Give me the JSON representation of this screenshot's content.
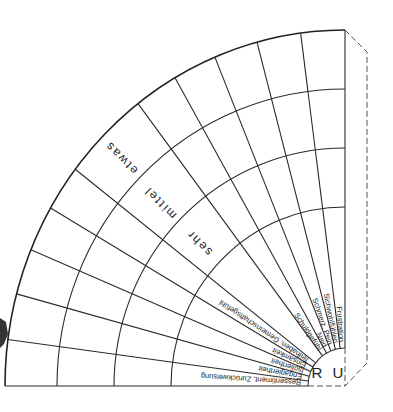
{
  "diagram": {
    "type": "quarter-circle emotion intensity wheel",
    "center_label": "R U",
    "intensity_levels": [
      "sehr",
      "mittel",
      "etwas"
    ],
    "categories_lower": [
      "Ressentiment, Zurückweisung",
      "Engagiertheit",
      "Isoliertheit",
      "Einsamkeit",
      "Teilhaben, Gemeinschaftsgefühl"
    ],
    "categories_upper": [
      "Schuldgefühl",
      "Neid",
      "Schmerz, Pein",
      "Sichwohlfühlen",
      "Frustration"
    ],
    "colors": {
      "line": "#2a2a2a",
      "background": "#ffffff",
      "dashed": "#555555"
    }
  }
}
